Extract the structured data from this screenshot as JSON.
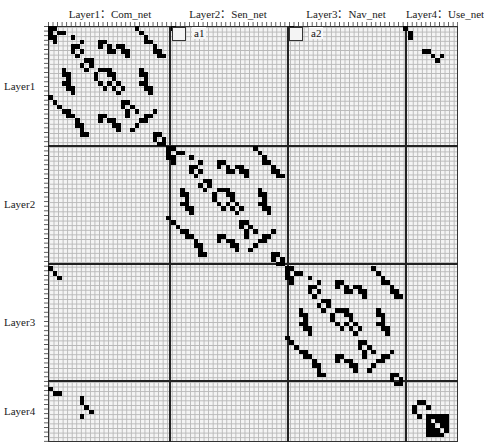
{
  "columns": [
    {
      "label": "Layer1：Com_net",
      "x": 110
    },
    {
      "label": "Layer2：Sen_net",
      "x": 228
    },
    {
      "label": "Layer3：Nav_net",
      "x": 346
    },
    {
      "label": "Layer4：Use_net",
      "x": 445
    }
  ],
  "rows": [
    {
      "label": "Layer1",
      "y": 86
    },
    {
      "label": "Layer2",
      "y": 204
    },
    {
      "label": "Layer3",
      "y": 322
    },
    {
      "label": "Layer4",
      "y": 411
    }
  ],
  "insets": [
    {
      "label": "a1",
      "x": 172,
      "y": 27
    },
    {
      "label": "a2",
      "x": 289,
      "y": 27
    }
  ],
  "matrix": {
    "cell_w": 4.556,
    "cell_h": 4.622,
    "block_sizes": [
      26,
      26,
      26,
      12
    ],
    "filled_color": "#000000",
    "empty_color": "#f4f4f4",
    "grid_color": "#b8b8b8"
  }
}
